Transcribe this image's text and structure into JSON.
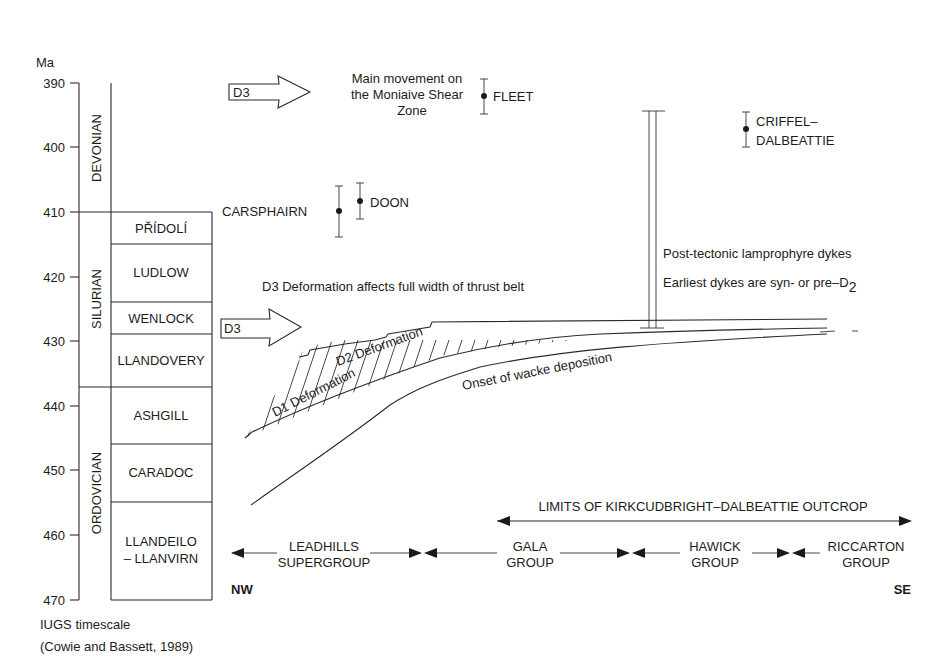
{
  "axis": {
    "unit_label": "Ma",
    "ticks": [
      "390",
      "400",
      "410",
      "420",
      "430",
      "440",
      "450",
      "460",
      "470"
    ],
    "caption_line1": "IUGS timescale",
    "caption_line2": "(Cowie and Bassett, 1989)"
  },
  "eras": {
    "devonian": "DEVONIAN",
    "silurian": "SILURIAN",
    "ordovician": "ORDOVICIAN"
  },
  "epochs": {
    "pridoli": "PŘÍDOLÍ",
    "ludlow": "LUDLOW",
    "wenlock": "WENLOCK",
    "llandovery": "LLANDOVERY",
    "ashgill": "ASHGILL",
    "caradoc": "CARADOC",
    "llandeilo_1": "LLANDEILO",
    "llandeilo_2": "– LLANVIRN"
  },
  "events": {
    "d3_top_arrow": "D3",
    "main_movement_1": "Main movement on",
    "main_movement_2": "the Moniaive Shear",
    "main_movement_3": "Zone",
    "d3_mid_arrow": "D3",
    "d3_full_width": "D3  Deformation affects full width of thrust belt",
    "d2_deformation": "D2 Deformation",
    "d1_deformation": "D1 Deformation",
    "onset_wacke": "Onset of wacke deposition",
    "dykes_1": "Post-tectonic lamprophyre dykes",
    "dykes_2_main": "Earliest dykes are syn- or pre–D",
    "dykes_2_sub": "2"
  },
  "intrusions": {
    "fleet": "FLEET",
    "criffel_1": "CRIFFEL–",
    "criffel_2": "DALBEATTIE",
    "carsphairn": "CARSPHAIRN",
    "doon": "DOON"
  },
  "groups": {
    "limits": "LIMITS OF KIRKCUDBRIGHT–DALBEATTIE OUTCROP",
    "leadhills_1": "LEADHILLS",
    "leadhills_2": "SUPERGROUP",
    "gala_1": "GALA",
    "gala_2": "GROUP",
    "hawick_1": "HAWICK",
    "hawick_2": "GROUP",
    "riccarton_1": "RICCARTON",
    "riccarton_2": "GROUP",
    "nw": "NW",
    "se": "SE"
  }
}
